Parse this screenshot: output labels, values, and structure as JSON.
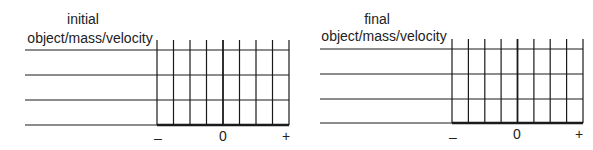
{
  "panels": [
    {
      "id": "initial",
      "title_line1": "initial",
      "title_line2": "object/mass/velocity",
      "axis": {
        "minus": "–",
        "zero": "0",
        "plus": "+"
      },
      "rows": 4,
      "grid_columns": 8
    },
    {
      "id": "final",
      "title_line1": "final",
      "title_line2": "object/mass/velocity",
      "axis": {
        "minus": "–",
        "zero": "0",
        "plus": "+"
      },
      "rows": 4,
      "grid_columns": 8
    }
  ],
  "colors": {
    "line": "#1a1a1a",
    "text": "#222222",
    "background": "#ffffff"
  }
}
